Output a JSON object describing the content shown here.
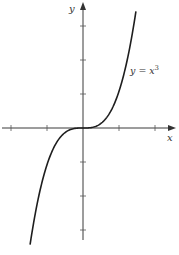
{
  "chart_data": {
    "type": "line",
    "title": "",
    "function": "y = x^3",
    "annotation": {
      "text": "y = x",
      "superscript": "3",
      "position": "right of curve, upper region"
    },
    "xlabel": "x",
    "ylabel": "y",
    "x_ticks": [
      -2,
      -1,
      1,
      2
    ],
    "y_ticks": [
      -3,
      -2,
      -1,
      1,
      2,
      3
    ],
    "tick_labels_shown": false,
    "grid": false,
    "legend": "none",
    "series": [
      {
        "name": "y = x^3",
        "x": [
          -1.47,
          -1.25,
          -1.0,
          -0.75,
          -0.5,
          -0.25,
          0,
          0.25,
          0.5,
          0.75,
          1.0,
          1.25,
          1.47
        ],
        "y": [
          -3.18,
          -1.95,
          -1.0,
          -0.42,
          -0.125,
          -0.016,
          0,
          0.016,
          0.125,
          0.42,
          1.0,
          1.95,
          3.18
        ]
      }
    ],
    "xlim": [
      -2.2,
      2.6
    ],
    "ylim": [
      -3.4,
      3.7
    ]
  },
  "labels": {
    "x_axis": "x",
    "y_axis": "y",
    "curve_main": "y = x",
    "curve_exp": "3"
  },
  "colors": {
    "curve": "#1e1e1e",
    "axis": "#3a3a3a",
    "background": "#ffffff"
  }
}
